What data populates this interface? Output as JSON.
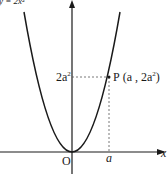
{
  "diagram": {
    "top_label": "y = 2x²",
    "axes": {
      "x_label": "x",
      "origin_label": "O"
    },
    "point": {
      "name": "P",
      "label_prefix": "P",
      "label_coords": "(a , 2a",
      "label_sup": "2",
      "label_close": ")",
      "x_tick": "a",
      "y_tick_base": "2a",
      "y_tick_sup": "2"
    },
    "colors": {
      "curve": "#1a1a1a",
      "axis": "#1a1a1a",
      "guide": "#555555"
    }
  }
}
